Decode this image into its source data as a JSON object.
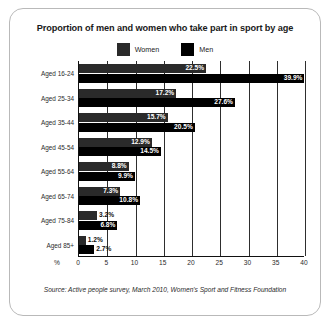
{
  "card": {
    "title": "Proportion of men and women who take part in sport by age",
    "source": "Source: Active people survey, March 2010, Women's Sport and Fitness Foundation"
  },
  "legend": {
    "items": [
      {
        "label": "Women",
        "color": "#2a2a2a",
        "name": "legend-swatch-women"
      },
      {
        "label": "Men",
        "color": "#000000",
        "name": "legend-swatch-men"
      }
    ]
  },
  "axis": {
    "unit": "%",
    "ticks": [
      "0",
      "5",
      "10",
      "15",
      "20",
      "25",
      "30",
      "35",
      "40"
    ]
  },
  "chart_data": {
    "type": "bar",
    "orientation": "horizontal",
    "title": "Proportion of men and women who take part in sport by age",
    "xlabel": "%",
    "ylabel": "",
    "xlim": [
      0,
      40
    ],
    "xticks": [
      0,
      5,
      10,
      15,
      20,
      25,
      30,
      35,
      40
    ],
    "grid": "vertical",
    "legend_position": "top-center",
    "categories": [
      "Aged 16-24",
      "Aged 25-34",
      "Aged 35-44",
      "Aged 45-54",
      "Aged 55-64",
      "Aged 65-74",
      "Aged 75-84",
      "Aged 85+"
    ],
    "series": [
      {
        "name": "Women",
        "color": "#2a2a2a",
        "values": [
          22.5,
          17.2,
          15.7,
          12.9,
          8.8,
          7.3,
          3.2,
          1.2
        ],
        "labels": [
          "22.5%",
          "17.2%",
          "15.7%",
          "12.9%",
          "8.8%",
          "7.3%",
          "3.2%",
          "1.2%"
        ]
      },
      {
        "name": "Men",
        "color": "#000000",
        "values": [
          39.9,
          27.6,
          20.5,
          14.5,
          9.9,
          10.8,
          6.8,
          2.7
        ],
        "labels": [
          "39.9%",
          "27.6%",
          "20.5%",
          "14.5%",
          "9.9%",
          "10.8%",
          "6.8%",
          "2.7%"
        ]
      }
    ]
  }
}
